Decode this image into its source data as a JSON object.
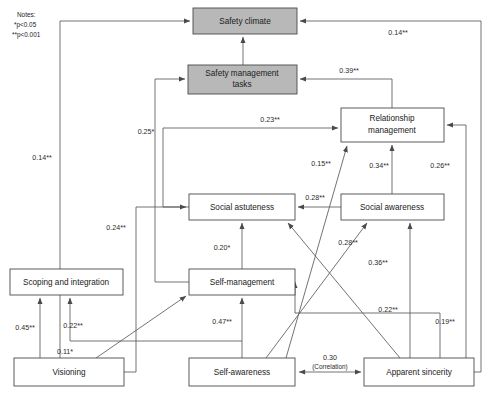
{
  "diagram": {
    "notes": {
      "heading": "Notes:",
      "line1": "*p<0.05",
      "line2": "**p<0.001"
    },
    "colors": {
      "shaded_node_fill": "#b8b8b8",
      "plain_node_fill": "#ffffff",
      "node_stroke": "#4a4a4a",
      "edge_stroke": "#5a5a5a",
      "text": "#1a1a1a",
      "background": "#ffffff"
    },
    "nodes": [
      {
        "id": "safety_climate",
        "label": "Safety climate",
        "style": "shaded",
        "x": 193,
        "y": 8,
        "w": 104,
        "h": 26
      },
      {
        "id": "safety_mgmt_tasks",
        "label": "Safety management tasks",
        "style": "shaded",
        "x": 188,
        "y": 65,
        "w": 109,
        "h": 29,
        "line1": "Safety management",
        "line2": "tasks"
      },
      {
        "id": "relationship_mgmt",
        "label": "Relationship management",
        "style": "plain",
        "x": 341,
        "y": 108,
        "w": 103,
        "h": 34,
        "line1": "Relationship",
        "line2": "management"
      },
      {
        "id": "social_astuteness",
        "label": "Social astuteness",
        "style": "plain",
        "x": 189,
        "y": 194,
        "w": 106,
        "h": 26
      },
      {
        "id": "social_awareness",
        "label": "Social awareness",
        "style": "plain",
        "x": 341,
        "y": 194,
        "w": 103,
        "h": 26
      },
      {
        "id": "self_management",
        "label": "Self-management",
        "style": "plain",
        "x": 189,
        "y": 269,
        "w": 106,
        "h": 26
      },
      {
        "id": "scoping_integration",
        "label": "Scoping and integration",
        "style": "plain",
        "x": 10,
        "y": 269,
        "w": 113,
        "h": 26
      },
      {
        "id": "visioning",
        "label": "Visioning",
        "style": "plain",
        "x": 14,
        "y": 358,
        "w": 110,
        "h": 28
      },
      {
        "id": "self_awareness",
        "label": "Self-awareness",
        "style": "plain",
        "x": 189,
        "y": 358,
        "w": 106,
        "h": 28
      },
      {
        "id": "apparent_sincerity",
        "label": "Apparent sincerity",
        "style": "plain",
        "x": 364,
        "y": 358,
        "w": 110,
        "h": 28
      }
    ],
    "edges": [
      {
        "id": "e_apparent_to_climate",
        "from": "apparent_sincerity",
        "to": "safety_climate",
        "label": "0.14**",
        "label_x": 398,
        "label_y": 33
      },
      {
        "id": "e_visioning_to_climate",
        "from": "visioning",
        "to": "safety_climate",
        "label": "0.14**",
        "label_x": 42,
        "label_y": 158
      },
      {
        "id": "e_relmgmt_to_safetytasks",
        "from": "relationship_mgmt",
        "to": "safety_mgmt_tasks",
        "label": "0.39**",
        "label_x": 349,
        "label_y": 71
      },
      {
        "id": "e_selfmgmt_to_safetytasks",
        "from": "self_management",
        "to": "safety_mgmt_tasks",
        "label": "0.25*",
        "label_x": 146,
        "label_y": 132
      },
      {
        "id": "e_astuteness_to_relmgmt",
        "from": "social_astuteness",
        "to": "relationship_mgmt",
        "label": "0.23**",
        "label_x": 270,
        "label_y": 120
      },
      {
        "id": "e_selfaware_to_relmgmt",
        "from": "self_awareness",
        "to": "relationship_mgmt",
        "label": "0.15**",
        "label_x": 321,
        "label_y": 164
      },
      {
        "id": "e_socawareness_to_relmgmt",
        "from": "social_awareness",
        "to": "relationship_mgmt",
        "label": "0.34**",
        "label_x": 379,
        "label_y": 166
      },
      {
        "id": "e_apparent_to_relmgmt",
        "from": "apparent_sincerity",
        "to": "relationship_mgmt",
        "label": "0.26**",
        "label_x": 440,
        "label_y": 166
      },
      {
        "id": "e_visioning_to_astuteness",
        "from": "visioning",
        "to": "social_astuteness",
        "label": "0.24**",
        "label_x": 116,
        "label_y": 228
      },
      {
        "id": "e_socaware_to_astuteness",
        "from": "social_awareness",
        "to": "social_astuteness",
        "label": "0.28**",
        "label_x": 315,
        "label_y": 198
      },
      {
        "id": "e_selfmgmt_to_astuteness",
        "from": "self_management",
        "to": "social_astuteness",
        "label": "0.20*",
        "label_x": 222,
        "label_y": 248
      },
      {
        "id": "e_selfaware_to_socaware",
        "from": "self_awareness",
        "to": "social_awareness",
        "label": "0.28**",
        "label_x": 348,
        "label_y": 243
      },
      {
        "id": "e_apparent_to_socaware",
        "from": "apparent_sincerity",
        "to": "social_awareness",
        "label": "0.36**",
        "label_x": 378,
        "label_y": 263
      },
      {
        "id": "e_apparent_to_astuteness",
        "from": "apparent_sincerity",
        "to": "social_astuteness",
        "label": "0.22**",
        "label_x": 388,
        "label_y": 310
      },
      {
        "id": "e_apparent_to_selfmgmt",
        "from": "apparent_sincerity",
        "to": "self_management",
        "label": "0.19**",
        "label_x": 445,
        "label_y": 322
      },
      {
        "id": "e_selfaware_to_selfmgmt",
        "from": "self_awareness",
        "to": "self_management",
        "label": "0.47**",
        "label_x": 222,
        "label_y": 322
      },
      {
        "id": "e_visioning_to_scoping",
        "from": "visioning",
        "to": "scoping_integration",
        "label": "0.45**",
        "label_x": 25,
        "label_y": 328
      },
      {
        "id": "e_selfaware_to_scoping",
        "from": "self_awareness",
        "to": "scoping_integration",
        "label": "0.22**",
        "label_x": 73,
        "label_y": 326
      },
      {
        "id": "e_visioning_to_selfmgmt",
        "from": "visioning",
        "to": "self_management",
        "label": "0.11*",
        "label_x": 65,
        "label_y": 352
      }
    ],
    "correlation_edge": {
      "id": "e_selfaware_apparent_corr",
      "from": "self_awareness",
      "to": "apparent_sincerity",
      "value": "0.30",
      "caption": "(Correlation)",
      "label_x": 330,
      "label_y": 362
    }
  }
}
